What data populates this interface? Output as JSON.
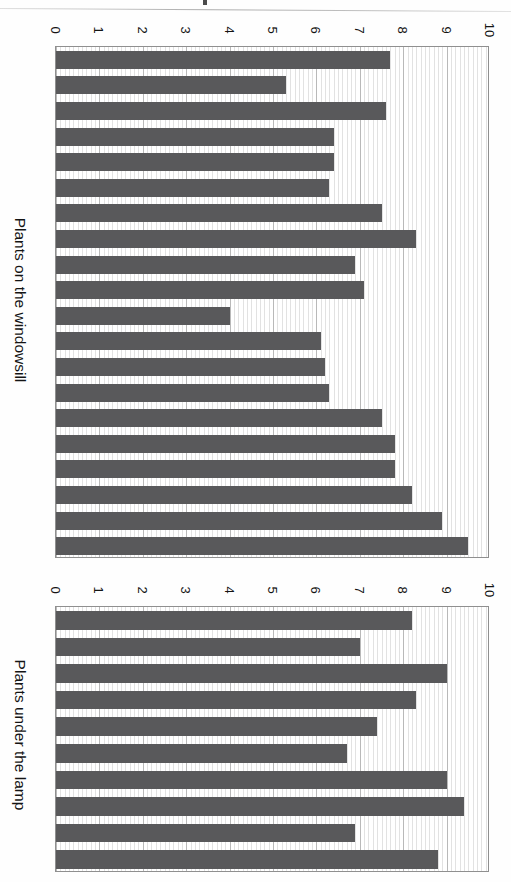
{
  "document": {
    "kind": "scanned-figure-page",
    "orientation": "rotated-90-clockwise",
    "bar_color": "#59595b",
    "grid_color": "#b9b9b9",
    "axis_color": "#8f8f8f"
  },
  "charts": [
    {
      "id": "windowsill",
      "title": "Plants on the windowsill",
      "tick_labels": [
        "0",
        "1",
        "2",
        "3",
        "4",
        "5",
        "6",
        "7",
        "8",
        "9",
        "10"
      ]
    },
    {
      "id": "lamp",
      "title": "Plants under the lamp",
      "tick_labels": [
        "0",
        "1",
        "2",
        "3",
        "4",
        "5",
        "6",
        "7",
        "8",
        "9",
        "10"
      ]
    }
  ],
  "chart_data": [
    {
      "type": "bar",
      "orientation": "horizontal",
      "title": "Plants on the windowsill",
      "xlabel": "",
      "ylabel": "Plants on the windowsill",
      "categories": [
        "1",
        "2",
        "3",
        "4",
        "5",
        "6",
        "7",
        "8",
        "9",
        "10",
        "11",
        "12",
        "13",
        "14",
        "15",
        "16",
        "17",
        "18",
        "19",
        "20"
      ],
      "values": [
        7.7,
        5.3,
        7.6,
        6.4,
        6.4,
        6.3,
        7.5,
        8.3,
        6.9,
        7.1,
        4.0,
        6.1,
        6.2,
        6.3,
        7.5,
        7.8,
        7.8,
        8.2,
        8.9,
        9.5
      ],
      "xlim": [
        0,
        10
      ],
      "ylim": [
        0,
        10
      ],
      "tick_labels": [
        "0",
        "1",
        "2",
        "3",
        "4",
        "5",
        "6",
        "7",
        "8",
        "9",
        "10"
      ],
      "tick_values": [
        0,
        1,
        2,
        3,
        4,
        5,
        6,
        7,
        8,
        9,
        10
      ],
      "grid": true,
      "minor_grid": true,
      "legend": false,
      "legend_position": "none",
      "series": [
        {
          "name": "Plants on the windowsill",
          "values": [
            7.7,
            5.3,
            7.6,
            6.4,
            6.4,
            6.3,
            7.5,
            8.3,
            6.9,
            7.1,
            4.0,
            6.1,
            6.2,
            6.3,
            7.5,
            7.8,
            7.8,
            8.2,
            8.9,
            9.5
          ]
        }
      ]
    },
    {
      "type": "bar",
      "orientation": "horizontal",
      "title": "Plants under the lamp",
      "xlabel": "",
      "ylabel": "Plants under the lamp",
      "categories": [
        "1",
        "2",
        "3",
        "4",
        "5",
        "6",
        "7",
        "8",
        "9"
      ],
      "values": [
        8.2,
        7.0,
        9.0,
        8.3,
        7.4,
        6.7,
        9.0,
        9.4,
        6.9,
        8.8
      ],
      "xlim": [
        0,
        10
      ],
      "ylim": [
        0,
        10
      ],
      "tick_labels": [
        "0",
        "1",
        "2",
        "3",
        "4",
        "5",
        "6",
        "7",
        "8",
        "9",
        "10"
      ],
      "tick_values": [
        0,
        1,
        2,
        3,
        4,
        5,
        6,
        7,
        8,
        9,
        10
      ],
      "grid": true,
      "minor_grid": true,
      "legend": false,
      "legend_position": "none",
      "series": [
        {
          "name": "Plants under the lamp",
          "values": [
            8.2,
            7.0,
            9.0,
            8.3,
            7.4,
            6.7,
            9.0,
            9.4,
            6.9,
            8.8
          ]
        }
      ]
    }
  ]
}
